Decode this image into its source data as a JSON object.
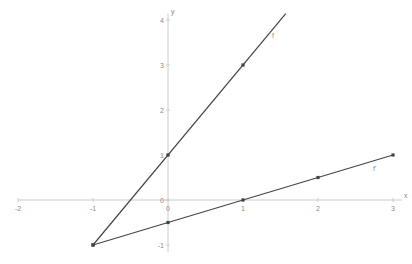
{
  "chart_data": {
    "type": "line",
    "title": "",
    "xlabel": "x",
    "ylabel": "y",
    "xlim": [
      -2,
      3
    ],
    "ylim": [
      -1,
      4
    ],
    "grid": false,
    "x_ticks": [
      "-2",
      "-1",
      "0",
      "1",
      "2",
      "3"
    ],
    "y_ticks": [
      "-1",
      "0",
      "1",
      "2",
      "3",
      "4"
    ],
    "series": [
      {
        "name": "f",
        "equation": "y = 2x + 1",
        "points": [
          [
            -1,
            -1
          ],
          [
            0,
            1
          ],
          [
            1,
            3
          ]
        ],
        "x_range": [
          -1,
          1.57
        ]
      },
      {
        "name": "f'",
        "equation": "y = 0.5x - 0.5",
        "points": [
          [
            -1,
            -1
          ],
          [
            0,
            -0.5
          ],
          [
            1,
            0
          ],
          [
            2,
            0.5
          ],
          [
            3,
            1
          ]
        ],
        "x_range": [
          -1,
          3
        ]
      }
    ],
    "labels": {
      "f": "f",
      "fprime": "f'"
    },
    "colors": {
      "axis": "#cccccc",
      "line": "#444444",
      "text": "#8a8a8a"
    }
  }
}
